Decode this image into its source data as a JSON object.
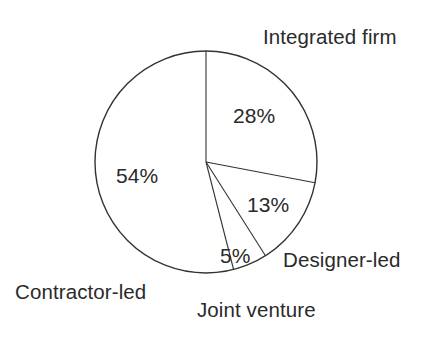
{
  "chart_data": {
    "type": "pie",
    "title": "",
    "categories": [
      "Integrated firm",
      "Designer-led",
      "Joint venture",
      "Contractor-led"
    ],
    "values": [
      28,
      13,
      5,
      54
    ],
    "value_labels": [
      "28%",
      "13%",
      "5%",
      "54%"
    ],
    "units": "percent",
    "total": 100,
    "start_angle_deg": 0,
    "direction": "clockwise",
    "legend": "none",
    "grid": false,
    "slice_style": {
      "fill": "#ffffff",
      "stroke": "#333333",
      "stroke_width": 1.1
    },
    "slices": [
      {
        "label": "Integrated firm",
        "value": 28,
        "value_label": "28%",
        "start_deg": 0,
        "end_deg": 100.8
      },
      {
        "label": "Designer-led",
        "value": 13,
        "value_label": "13%",
        "start_deg": 100.8,
        "end_deg": 147.6
      },
      {
        "label": "Joint venture",
        "value": 5,
        "value_label": "5%",
        "start_deg": 147.6,
        "end_deg": 165.6
      },
      {
        "label": "Contractor-led",
        "value": 54,
        "value_label": "54%",
        "start_deg": 165.6,
        "end_deg": 360
      }
    ]
  },
  "labels": {
    "integrated_firm": "Integrated firm",
    "designer_led": "Designer-led",
    "joint_venture": "Joint venture",
    "contractor_led": "Contractor-led"
  },
  "percentages": {
    "integrated_firm": "28%",
    "designer_led": "13%",
    "joint_venture": "5%",
    "contractor_led": "54%"
  },
  "colors": {
    "background": "#ffffff",
    "text": "#2a2a2a",
    "outline": "#333333"
  }
}
